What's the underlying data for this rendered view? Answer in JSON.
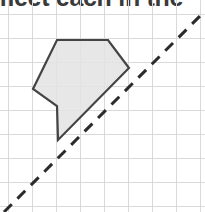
{
  "page": {
    "width": 205,
    "height": 212,
    "background": "#ffffff"
  },
  "heading": {
    "text": "meet each in the",
    "note": "partially cropped text line at top of image",
    "color": "#3a3a3a"
  },
  "figure": {
    "name": "polygon-on-grid-with-mirror-line",
    "grid": {
      "line_color": "#d9d9d9",
      "line_width": 1,
      "spacing": 24,
      "origin_x": 8,
      "origin_y": 14,
      "x_lines": [
        8,
        32,
        56,
        80,
        104,
        128,
        152,
        176,
        200
      ],
      "y_lines": [
        14,
        38,
        62,
        86,
        110,
        134,
        158,
        182,
        206
      ]
    },
    "shape": {
      "label": "shaded-polygon",
      "fill": "#e3e3e3",
      "fill_opacity": 0.85,
      "stroke": "#444444",
      "stroke_width": 2.2,
      "points": "57,40 108,40 129,68 58,140 57,106 33,89",
      "vertices": [
        [
          57,
          40
        ],
        [
          108,
          40
        ],
        [
          129,
          68
        ],
        [
          58,
          140
        ],
        [
          57,
          106
        ],
        [
          33,
          89
        ]
      ]
    },
    "mirror_line": {
      "label": "dashed-diagonal-line",
      "stroke": "#2b2b2b",
      "stroke_width": 3,
      "dash_pattern": "11 8",
      "x1": 4,
      "y1": 212,
      "x2": 203,
      "y2": 13,
      "angle_degrees": 45
    }
  },
  "colors": {
    "grid": "#d9d9d9",
    "shape_fill": "#e3e3e3",
    "shape_stroke": "#444444",
    "dash_stroke": "#2b2b2b",
    "text": "#3a3a3a",
    "background": "#ffffff"
  }
}
